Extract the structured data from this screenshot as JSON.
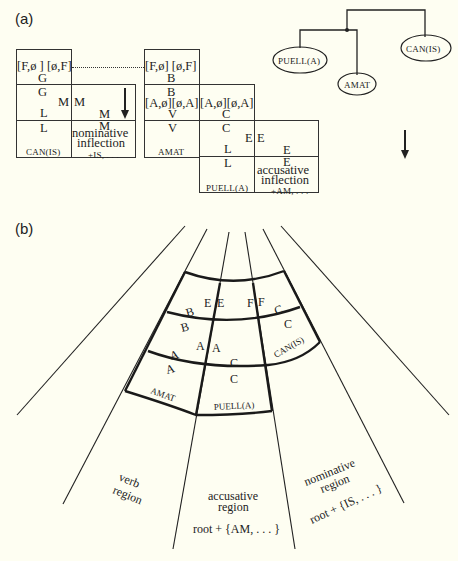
{
  "panel_a": {
    "label": "(a)",
    "can": {
      "top": "[F,ø ] [ø,F]",
      "g1": "G",
      "g2": "G",
      "m1": "M",
      "l1": "L",
      "l2": "L",
      "name": "CAN(IS)"
    },
    "nom": {
      "m1": "M",
      "m2": "M",
      "m3": "M",
      "title1": "nominative",
      "title2": "inflection",
      "suffix": "+IS, . . ."
    },
    "amat": {
      "top": "[F,ø]  [ø,F]",
      "b1": "B",
      "b2": "B",
      "mid": "[A,ø][ø,A]",
      "v1": "V",
      "v2": "V",
      "name": "AMAT"
    },
    "puell": {
      "mid": "[A,ø][ø,A]",
      "c1": "C",
      "c2": "C",
      "e1": "E",
      "l1": "L",
      "l2": "L",
      "name": "PUELL(A)"
    },
    "acc": {
      "e1": "E",
      "e2": "E",
      "e3": "E",
      "title1": "accusative",
      "title2": "inflection",
      "suffix": "+AM, . . ."
    },
    "tree": {
      "nodes": [
        "PUELL(A)",
        "AMAT",
        "CAN(IS)"
      ]
    }
  },
  "panel_b": {
    "label": "(b)",
    "cells": {
      "e1": "E",
      "e2": "E",
      "f1": "F",
      "f2": "F",
      "b1": "B",
      "b2": "B",
      "c1": "C",
      "c2": "C",
      "a1": "A",
      "a2": "A",
      "a3": "A",
      "a4": "A",
      "c3": "C",
      "c4": "C",
      "can": "CAN(IS)",
      "amat": "AMAT",
      "puell": "PUELL(A)"
    },
    "regions": {
      "verb1": "verb",
      "verb2": "region",
      "acc1": "accusative",
      "acc2": "region",
      "acc3": "root + {AM, . . . }",
      "nom1": "nominative",
      "nom2": "region",
      "nom3": "root + {IS, . . . }"
    }
  }
}
